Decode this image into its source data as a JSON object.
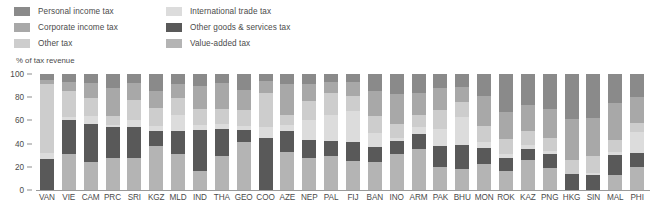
{
  "axis_title": "% of tax revenue",
  "legend": {
    "left": [
      {
        "label": "Personal income tax",
        "color": "#8a8a8a",
        "key": "personal_income"
      },
      {
        "label": "Corporate income tax",
        "color": "#a8a8a8",
        "key": "corporate_income"
      },
      {
        "label": "Other tax",
        "color": "#cdcdcd",
        "key": "other_tax"
      }
    ],
    "right": [
      {
        "label": "International trade tax",
        "color": "#dcdcdc",
        "key": "international_trade"
      },
      {
        "label": "Other goods & services tax",
        "color": "#595959",
        "key": "other_goods_services"
      },
      {
        "label": "Value-added tax",
        "color": "#b4b4b4",
        "key": "value_added"
      }
    ]
  },
  "chart_data": {
    "type": "bar",
    "subtype": "stacked-bar-100",
    "title": "",
    "xlabel": "",
    "ylabel": "% of tax revenue",
    "ylim": [
      0,
      100
    ],
    "yticks": [
      0,
      20,
      40,
      60,
      80,
      100
    ],
    "grid": false,
    "legend_position": "top",
    "categories": [
      "VAN",
      "VIE",
      "CAM",
      "PRC",
      "SRI",
      "KGZ",
      "MLD",
      "IND",
      "THA",
      "GEO",
      "COO",
      "AZE",
      "NEP",
      "PAL",
      "FIJ",
      "BAN",
      "INO",
      "ARM",
      "PAK",
      "BHU",
      "MON",
      "ROK",
      "KAZ",
      "PNG",
      "HKG",
      "SIN",
      "MAL",
      "PHI"
    ],
    "series": [
      {
        "name": "Value-added tax",
        "color": "#b4b4b4",
        "values": [
          0,
          31,
          24,
          28,
          28,
          38,
          31,
          16,
          29,
          41,
          0,
          33,
          28,
          29,
          25,
          24,
          31,
          35,
          20,
          18,
          22,
          16,
          26,
          19,
          0,
          0,
          13,
          20
        ]
      },
      {
        "name": "Other goods & services tax",
        "color": "#595959",
        "values": [
          27,
          29,
          33,
          26,
          26,
          13,
          20,
          36,
          24,
          11,
          45,
          18,
          15,
          13,
          16,
          13,
          11,
          13,
          18,
          21,
          14,
          12,
          9,
          12,
          14,
          13,
          17,
          12
        ]
      },
      {
        "name": "International trade tax",
        "color": "#dcdcdc",
        "values": [
          5,
          3,
          7,
          2,
          6,
          4,
          14,
          4,
          4,
          3,
          9,
          5,
          17,
          23,
          27,
          12,
          3,
          6,
          15,
          24,
          5,
          3,
          4,
          3,
          0,
          2,
          3,
          18
        ]
      },
      {
        "name": "Other tax",
        "color": "#cdcdcd",
        "values": [
          59,
          22,
          15,
          8,
          18,
          16,
          14,
          14,
          13,
          14,
          30,
          9,
          17,
          19,
          13,
          15,
          12,
          11,
          16,
          13,
          14,
          13,
          12,
          11,
          12,
          14,
          10,
          8
        ]
      },
      {
        "name": "Corporate income tax",
        "color": "#a8a8a8",
        "values": [
          4,
          8,
          13,
          24,
          14,
          14,
          12,
          20,
          22,
          17,
          10,
          26,
          14,
          9,
          12,
          21,
          26,
          19,
          19,
          13,
          26,
          23,
          22,
          25,
          35,
          33,
          32,
          22
        ]
      },
      {
        "name": "Personal income tax",
        "color": "#8a8a8a",
        "values": [
          5,
          7,
          8,
          12,
          8,
          15,
          9,
          10,
          8,
          14,
          6,
          9,
          9,
          7,
          7,
          15,
          17,
          16,
          12,
          11,
          19,
          33,
          27,
          30,
          39,
          38,
          25,
          20
        ]
      }
    ]
  }
}
